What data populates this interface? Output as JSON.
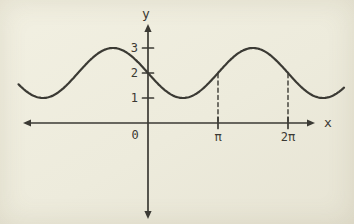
{
  "figure": {
    "background": "#edebdc",
    "ink_color": "#3b3a34",
    "y_axis_label": "y",
    "x_axis_label": "x",
    "origin_label": "0",
    "y_ticks": [
      {
        "value": 1,
        "label": "1"
      },
      {
        "value": 2,
        "label": "2"
      },
      {
        "value": 3,
        "label": "3"
      }
    ],
    "x_ticks": [
      {
        "pi_multiple": 1,
        "label": "π"
      },
      {
        "pi_multiple": 2,
        "label": "2π"
      }
    ]
  },
  "chart_data": {
    "type": "line",
    "title": "",
    "xlabel": "x",
    "ylabel": "y",
    "function": "y = 2 - sin x",
    "midline": 2,
    "amplitude": 1,
    "period_pi": 2,
    "x_range_pi": [
      -1.85,
      2.8
    ],
    "ylim": [
      0,
      3.5
    ],
    "y_tick_values": [
      1,
      2,
      3
    ],
    "x_tick_labels": [
      "0",
      "π",
      "2π"
    ],
    "grid": false,
    "legend": null,
    "key_points": [
      {
        "x": "-3π/2",
        "y": 1
      },
      {
        "x": "-π/2",
        "y": 3
      },
      {
        "x": "0",
        "y": 2
      },
      {
        "x": "π/2",
        "y": 1
      },
      {
        "x": "π",
        "y": 2
      },
      {
        "x": "3π/2",
        "y": 3
      },
      {
        "x": "2π",
        "y": 2
      },
      {
        "x": "5π/2",
        "y": 1
      }
    ],
    "dashed_guides": [
      {
        "at": "π",
        "pi_multiple": 1,
        "y_top": 2
      },
      {
        "at": "2π",
        "pi_multiple": 2,
        "y_top": 2
      }
    ]
  }
}
